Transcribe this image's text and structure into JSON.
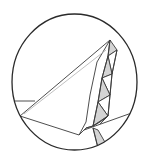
{
  "diagram": {
    "type": "origami-fold-detail",
    "colors": {
      "background": "#ffffff",
      "outline": "#3a3a3a",
      "crease": "#b0b0b0",
      "shade": "#d4d4d4",
      "circle": "#2a2a2a"
    },
    "circle": {
      "cx": 74.5,
      "cy": 82,
      "rx": 62.5,
      "ry": 68
    },
    "labels": []
  }
}
